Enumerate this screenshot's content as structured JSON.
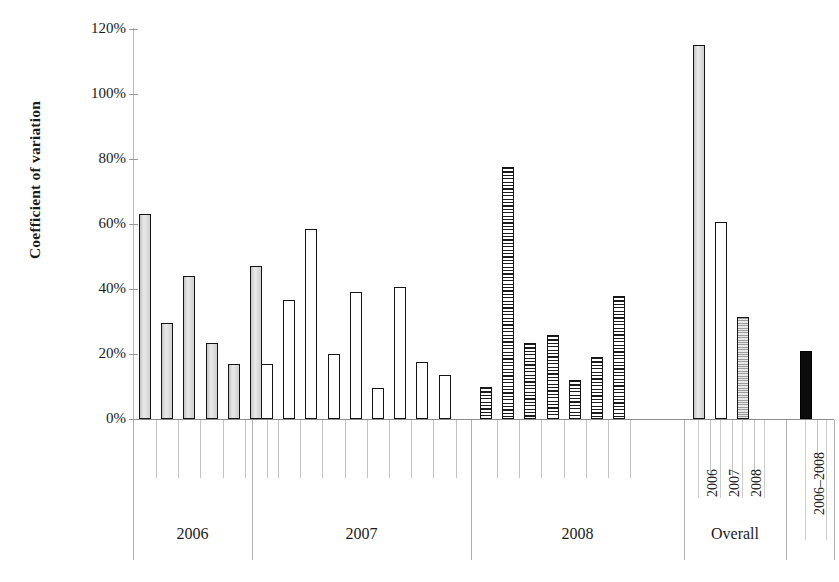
{
  "chart_data": {
    "type": "bar",
    "title": "",
    "xlabel": "",
    "ylabel": "Coefficient of variation",
    "ylim": [
      0,
      120
    ],
    "ytick_labels": [
      "0%",
      "20%",
      "40%",
      "60%",
      "80%",
      "100%",
      "120%"
    ],
    "ytick_values": [
      0,
      20,
      40,
      60,
      80,
      100,
      120
    ],
    "grid": false,
    "legend": "none",
    "groups": [
      {
        "name": "2006",
        "label": "2006",
        "style": "gray",
        "values": [
          63,
          29.5,
          44,
          23.5,
          17,
          47
        ]
      },
      {
        "name": "2007",
        "label": "2007",
        "style": "white",
        "values": [
          17,
          36.5,
          58.5,
          20,
          39,
          9.5,
          40.5,
          17.5,
          13.5
        ]
      },
      {
        "name": "2008",
        "label": "2008",
        "style": "hatch",
        "values": [
          10,
          77.5,
          23.5,
          26,
          12,
          19,
          38
        ],
        "first_bar_style": "hatch"
      },
      {
        "name": "Overall",
        "label": "Overall",
        "style": "mixed",
        "values": [
          115,
          60.5,
          31.5
        ],
        "bar_labels": [
          "2006",
          "2007",
          "2008"
        ],
        "bar_styles": [
          "gray",
          "white",
          "dots"
        ]
      },
      {
        "name": "Combined",
        "label": "",
        "style": "black",
        "values": [
          21
        ],
        "bar_labels": [
          "2006–2008"
        ],
        "bar_styles": [
          "black"
        ]
      }
    ]
  },
  "axis": {
    "y_title": "Coefficient of variation",
    "ticks": [
      "120%",
      "100%",
      "80%",
      "60%",
      "40%",
      "20%",
      "0%"
    ]
  },
  "x_group_labels": [
    "2006",
    "2007",
    "2008",
    "Overall"
  ],
  "x_rotated_labels": [
    "2006",
    "2007",
    "2008",
    "2006–2008"
  ],
  "colors": {
    "bar_outline": "#151515",
    "bar_gray_fill": "#d4d4d4",
    "bar_white_fill": "#ffffff",
    "bar_black_fill": "#0b0b0b",
    "axis_line": "#8c8c8c",
    "tick_line": "#c3c3c3",
    "text": "#1a1a1a",
    "background": "#ffffff"
  }
}
